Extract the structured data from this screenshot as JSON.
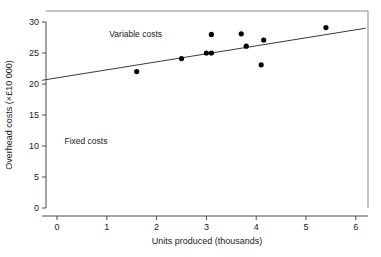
{
  "chart_data": {
    "type": "scatter",
    "title": "",
    "xlabel": "Units produced (thousands)",
    "ylabel": "Overhead costs (×£10 000)",
    "xlim": [
      -0.3,
      6.2
    ],
    "ylim": [
      0,
      31
    ],
    "xticks": [
      0,
      1,
      2,
      3,
      4,
      5,
      6
    ],
    "xtick_labels": [
      "0",
      "1",
      "2",
      "3",
      "4",
      "5",
      "6"
    ],
    "yticks": [
      0,
      5,
      10,
      15,
      20,
      25,
      30
    ],
    "ytick_labels": [
      "0",
      "5",
      "10",
      "15",
      "20",
      "25",
      "30"
    ],
    "grid": false,
    "legend": "none",
    "series": [
      {
        "name": "Observed overhead costs",
        "marker": "filled-circle",
        "color": "#000000",
        "points": [
          {
            "x": 1.6,
            "y": 22.0
          },
          {
            "x": 2.5,
            "y": 24.1
          },
          {
            "x": 3.0,
            "y": 25.0
          },
          {
            "x": 3.1,
            "y": 25.0
          },
          {
            "x": 3.1,
            "y": 28.0
          },
          {
            "x": 3.7,
            "y": 28.1
          },
          {
            "x": 3.8,
            "y": 26.1
          },
          {
            "x": 4.1,
            "y": 23.1
          },
          {
            "x": 4.15,
            "y": 27.1
          },
          {
            "x": 5.4,
            "y": 29.1
          }
        ]
      }
    ],
    "trend_line": {
      "name": "Total cost line",
      "color": "#3a3a3a",
      "x_start": -0.3,
      "y_start": 20.6,
      "x_end": 6.2,
      "y_end": 29.0,
      "intercept": 20.99,
      "slope": 1.292
    },
    "annotations": [
      {
        "id": "variable-costs",
        "text": "Variable costs",
        "x": 1.05,
        "y": 27.6
      },
      {
        "id": "fixed-costs",
        "text": "Fixed costs",
        "x": 0.15,
        "y": 10.4
      }
    ]
  }
}
